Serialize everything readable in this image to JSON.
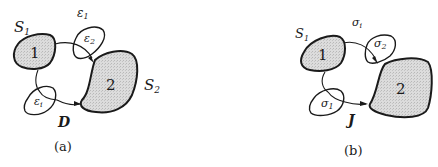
{
  "panels": [
    {
      "caption": "(a)",
      "set1_label": "S",
      "set1_sub": "1",
      "set2_label": "S",
      "set2_sub": "2",
      "region1_label": "1",
      "region2_label": "2",
      "top_label": "ε",
      "top_sub": "1",
      "small_top_label": "ε",
      "small_top_sub": "2",
      "small_bottom_label": "ε",
      "small_bottom_sub": "i",
      "path_label": "D"
    },
    {
      "caption": "(b)",
      "set1_label": "S",
      "set1_sub": "1",
      "region1_label": "1",
      "region2_label": "2",
      "top_label": "σ",
      "top_sub": "i",
      "small_top_label": "σ",
      "small_top_sub": "2",
      "small_bottom_label": "σ",
      "small_bottom_sub": "1",
      "path_label": "J"
    }
  ],
  "colors": {
    "ink": "#1a1a1a",
    "fill": "#d6d6d6"
  }
}
